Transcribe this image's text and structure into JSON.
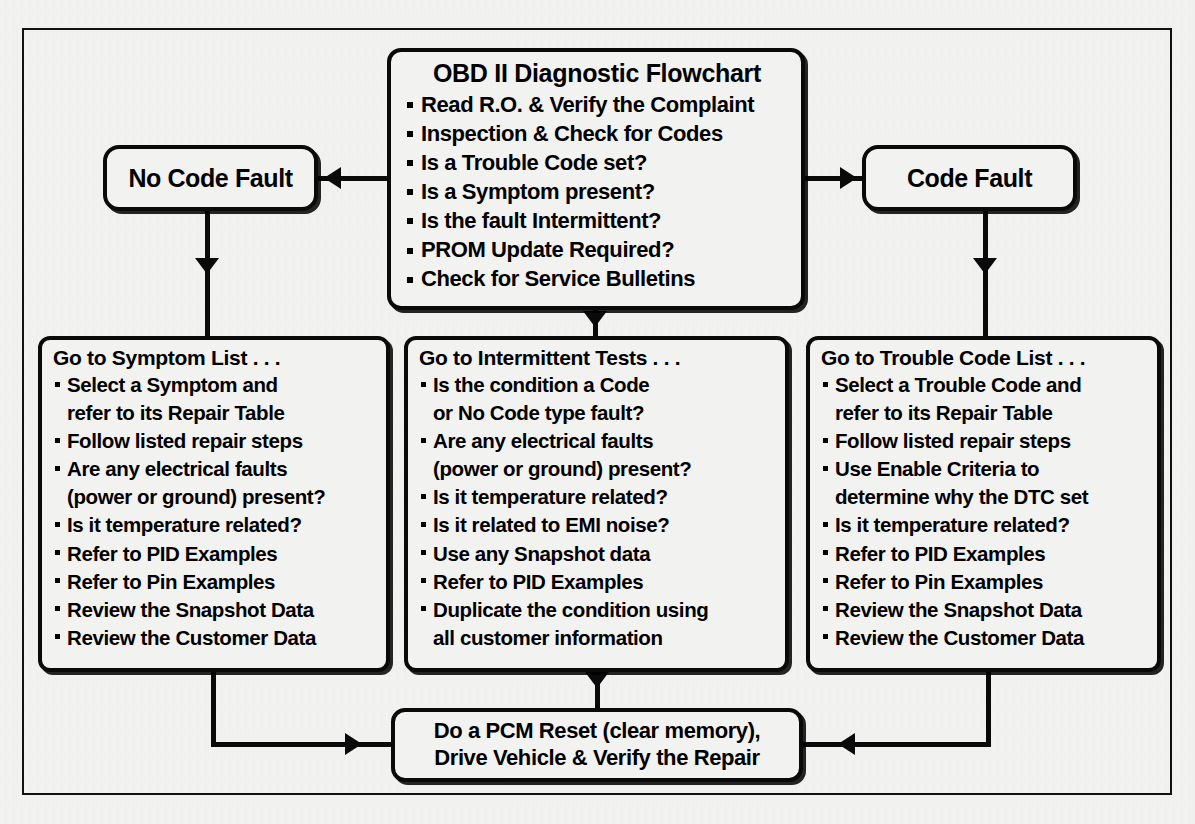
{
  "figure": {
    "kind": "flowchart",
    "frame_border_color": "#111111",
    "node_border_color": "#0a0a0a",
    "background_color": "#f2f2f0"
  },
  "main_box": {
    "title": "OBD II Diagnostic Flowchart",
    "items": [
      "Read R.O. & Verify the Complaint",
      "Inspection & Check for Codes",
      "Is a Trouble Code set?",
      "Is a Symptom present?",
      "Is the fault Intermittent?",
      "PROM Update Required?",
      "Check for Service Bulletins"
    ]
  },
  "no_code_box": {
    "title": "No Code Fault"
  },
  "code_box": {
    "title": "Code Fault"
  },
  "symptom_box": {
    "title": "Go to Symptom List . . .",
    "items": [
      {
        "text": "Select a Symptom and",
        "bullet": true
      },
      {
        "text": "refer to its Repair Table",
        "bullet": false
      },
      {
        "text": "Follow listed repair steps",
        "bullet": true
      },
      {
        "text": "Are any electrical faults",
        "bullet": true
      },
      {
        "text": "(power or ground) present?",
        "bullet": false
      },
      {
        "text": "Is it temperature related?",
        "bullet": true
      },
      {
        "text": "Refer to PID Examples",
        "bullet": true
      },
      {
        "text": "Refer to Pin Examples",
        "bullet": true
      },
      {
        "text": "Review the Snapshot Data",
        "bullet": true
      },
      {
        "text": "Review the Customer Data",
        "bullet": true
      }
    ]
  },
  "intermittent_box": {
    "title": "Go to Intermittent Tests . . .",
    "items": [
      {
        "text": "Is the condition a Code",
        "bullet": true
      },
      {
        "text": "or No Code type fault?",
        "bullet": false
      },
      {
        "text": "Are any electrical faults",
        "bullet": true
      },
      {
        "text": "(power or ground) present?",
        "bullet": false
      },
      {
        "text": "Is it temperature related?",
        "bullet": true
      },
      {
        "text": "Is it related to EMI noise?",
        "bullet": true
      },
      {
        "text": "Use any Snapshot data",
        "bullet": true
      },
      {
        "text": "Refer to PID Examples",
        "bullet": true
      },
      {
        "text": "Duplicate the condition using",
        "bullet": true
      },
      {
        "text": "all customer information",
        "bullet": false
      }
    ]
  },
  "trouble_box": {
    "title": "Go to Trouble Code List . . .",
    "items": [
      {
        "text": "Select a Trouble Code and",
        "bullet": true
      },
      {
        "text": "refer to its Repair Table",
        "bullet": false
      },
      {
        "text": "Follow listed repair steps",
        "bullet": true
      },
      {
        "text": "Use Enable Criteria to",
        "bullet": true
      },
      {
        "text": "determine why the DTC set",
        "bullet": false
      },
      {
        "text": "Is it temperature related?",
        "bullet": true
      },
      {
        "text": "Refer to PID Examples",
        "bullet": true
      },
      {
        "text": "Refer to Pin Examples",
        "bullet": true
      },
      {
        "text": "Review the Snapshot Data",
        "bullet": true
      },
      {
        "text": "Review the Customer Data",
        "bullet": true
      }
    ]
  },
  "pcm_box": {
    "line1": "Do a PCM Reset (clear memory),",
    "line2": "Drive Vehicle & Verify the Repair"
  },
  "connectors": [
    {
      "name": "main-to-no-code",
      "direction": "left"
    },
    {
      "name": "main-to-code",
      "direction": "right"
    },
    {
      "name": "no-code-to-symptom",
      "direction": "down"
    },
    {
      "name": "main-to-intermittent",
      "direction": "down"
    },
    {
      "name": "code-to-trouble",
      "direction": "down"
    },
    {
      "name": "intermittent-to-pcm",
      "direction": "down"
    },
    {
      "name": "symptom-to-pcm",
      "direction": "right"
    },
    {
      "name": "trouble-to-pcm",
      "direction": "left"
    }
  ]
}
